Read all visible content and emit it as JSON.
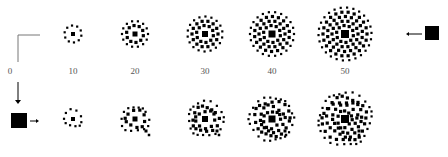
{
  "figure": {
    "labels": [
      "0",
      "10",
      "20",
      "30",
      "40",
      "50"
    ],
    "label_x": [
      10,
      73,
      135,
      205,
      272,
      345
    ],
    "rows": [
      {
        "name": "top-row",
        "y": 34,
        "centers": [
          73,
          135,
          205,
          272,
          345
        ]
      },
      {
        "name": "bottom-row",
        "y": 119,
        "centers": [
          73,
          135,
          205,
          272,
          345
        ]
      }
    ],
    "colors": {
      "ink": "#000000",
      "label": "#555555"
    }
  }
}
